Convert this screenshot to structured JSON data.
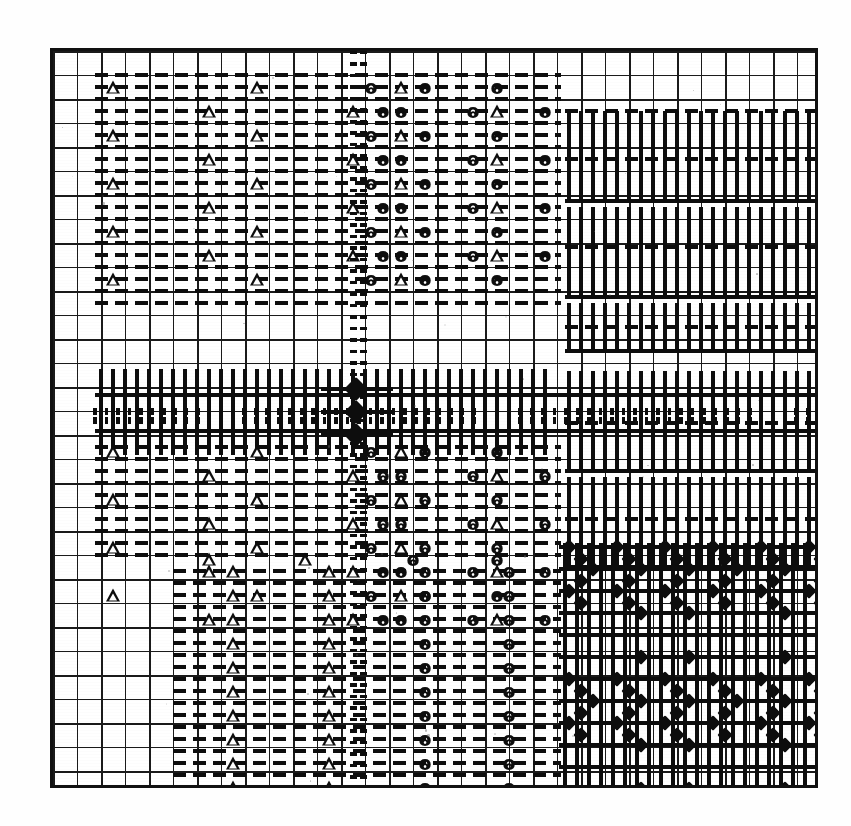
{
  "figure": {
    "title": "",
    "caption": "",
    "background_color": "#ffffff",
    "ink_color": "#0d0d0d"
  },
  "plot": {
    "frame": {
      "x": 50,
      "y": 48,
      "width": 768,
      "height": 740,
      "border_px": 3
    },
    "grid": {
      "columns": 32,
      "rows": 31,
      "cell_px": 24,
      "grid_on": true
    }
  },
  "legend_symbols": [
    {
      "name": "triangle-marker",
      "glyph": "triangle-up-open",
      "region": "left-half"
    },
    {
      "name": "vee-marker",
      "glyph": "v-down",
      "region": "center-right"
    },
    {
      "name": "diamond-marker",
      "glyph": "diamond-filled",
      "region": "lower-right"
    },
    {
      "name": "vertical-bar",
      "glyph": "bar-vertical",
      "region": "upper-right"
    },
    {
      "name": "dotted-band",
      "glyph": "dotted-line",
      "region": "center-cross"
    }
  ],
  "chart_data": {
    "type": "heatmap",
    "title": "",
    "xlabel": "",
    "ylabel": "",
    "grid": true,
    "legend": "none",
    "xlim": [
      0,
      32
    ],
    "ylim": [
      0,
      31
    ],
    "categories": [],
    "regions": [
      {
        "name": "upper-left-triangles",
        "symbol": "triangle",
        "x_range": [
          2,
          19
        ],
        "y_range": [
          1,
          9
        ],
        "density": "sparse-zigzag"
      },
      {
        "name": "upper-center-vees",
        "symbol": "vee",
        "x_range": [
          20,
          35
        ],
        "y_range": [
          1,
          9
        ],
        "density": "sparse-zigzag"
      },
      {
        "name": "upper-right-bars",
        "symbol": "bar",
        "x_range": [
          36,
          63
        ],
        "y_range": [
          1,
          19
        ],
        "density": "dense-columns"
      },
      {
        "name": "central-dotted-band",
        "symbol": "dots",
        "x_range": [
          2,
          63
        ],
        "y_range": [
          10,
          11
        ],
        "density": "continuous"
      },
      {
        "name": "central-dotted-column",
        "symbol": "dots",
        "x_range": [
          21,
          22
        ],
        "y_range": [
          0,
          31
        ],
        "density": "continuous"
      },
      {
        "name": "center-diamonds",
        "symbol": "diamond",
        "x_range": [
          21,
          22
        ],
        "y_range": [
          10,
          11
        ],
        "density": "three-stacked"
      },
      {
        "name": "mid-left-triangles",
        "symbol": "triangle",
        "x_range": [
          2,
          19
        ],
        "y_range": [
          12,
          20
        ],
        "density": "sparse-zigzag"
      },
      {
        "name": "mid-center-vees",
        "symbol": "vee",
        "x_range": [
          20,
          35
        ],
        "y_range": [
          12,
          20
        ],
        "density": "sparse-zigzag"
      },
      {
        "name": "lower-left-triangles",
        "symbol": "triangle",
        "x_range": [
          7,
          15
        ],
        "y_range": [
          21,
          30
        ],
        "density": "two-columns"
      },
      {
        "name": "lower-center-vees",
        "symbol": "vee",
        "x_range": [
          25,
          33
        ],
        "y_range": [
          21,
          30
        ],
        "density": "two-columns"
      },
      {
        "name": "lower-right-diamonds",
        "symbol": "diamond",
        "x_range": [
          36,
          62
        ],
        "y_range": [
          20,
          30
        ],
        "density": "lattice"
      }
    ],
    "series": [
      {
        "name": "triangle",
        "count": 74
      },
      {
        "name": "vee",
        "count": 70
      },
      {
        "name": "diamond",
        "count": 96
      },
      {
        "name": "bar",
        "count": 210
      }
    ]
  }
}
